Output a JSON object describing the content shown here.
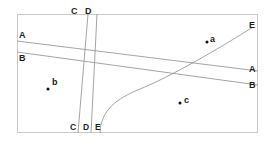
{
  "figure": {
    "title": "",
    "background_color": "#ffffff",
    "frame": {
      "x": 17,
      "y": 14,
      "width": 241,
      "height": 119,
      "stroke_color": "#c9c9c9",
      "stroke_width": 1
    },
    "line_color": "#9a9a9a",
    "label_color": "#231f20",
    "point_color": "#111111"
  },
  "labels": {
    "top_c": "C",
    "top_d": "D",
    "left_a": "A",
    "left_b": "B",
    "right_e": "E",
    "right_a": "A",
    "right_b": "B",
    "bottom_c": "C",
    "bottom_d": "D",
    "bottom_e": "E"
  },
  "points": [
    {
      "id": "a",
      "label": "a",
      "x": 207,
      "y": 42
    },
    {
      "id": "b",
      "label": "b",
      "x": 48,
      "y": 89
    },
    {
      "id": "c",
      "label": "c",
      "x": 180,
      "y": 103
    }
  ],
  "lines": [
    {
      "id": "A",
      "name": "line-a",
      "kind": "straight",
      "from": {
        "x": 17,
        "y": 41
      },
      "to": {
        "x": 258,
        "y": 71
      },
      "endpoint_labels": [
        "A",
        "A"
      ]
    },
    {
      "id": "B",
      "name": "line-b",
      "kind": "straight",
      "from": {
        "x": 17,
        "y": 52
      },
      "to": {
        "x": 258,
        "y": 85
      },
      "endpoint_labels": [
        "B",
        "B"
      ]
    },
    {
      "id": "C",
      "name": "line-c",
      "kind": "straight",
      "from": {
        "x": 88,
        "y": 14
      },
      "to": {
        "x": 78,
        "y": 133
      },
      "endpoint_labels": [
        "C",
        "C"
      ]
    },
    {
      "id": "D",
      "name": "line-d",
      "kind": "straight",
      "from": {
        "x": 97,
        "y": 14
      },
      "to": {
        "x": 91,
        "y": 133
      },
      "endpoint_labels": [
        "D",
        "D"
      ]
    },
    {
      "id": "E",
      "name": "curve-e",
      "kind": "curve",
      "from": {
        "x": 100,
        "y": 133
      },
      "to": {
        "x": 253,
        "y": 27
      },
      "control_1": {
        "x": 101,
        "y": 110
      },
      "control_2": {
        "x": 128,
        "y": 97
      },
      "endpoint_labels": [
        "E",
        "E"
      ]
    }
  ],
  "label_positions": {
    "top_c": {
      "x": 71,
      "y": 7
    },
    "top_d": {
      "x": 85,
      "y": 7
    },
    "left_a": {
      "x": 19,
      "y": 31
    },
    "left_b": {
      "x": 19,
      "y": 54
    },
    "right_e": {
      "x": 249,
      "y": 21
    },
    "right_a": {
      "x": 249,
      "y": 65
    },
    "right_b": {
      "x": 249,
      "y": 81
    },
    "bottom_c": {
      "x": 70,
      "y": 123
    },
    "bottom_d": {
      "x": 83,
      "y": 123
    },
    "bottom_e": {
      "x": 95,
      "y": 123
    }
  }
}
